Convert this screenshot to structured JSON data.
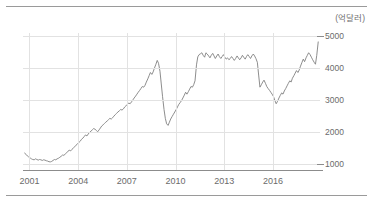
{
  "chart_data": {
    "type": "line",
    "title": "",
    "subtitle": "",
    "xlabel": "",
    "ylabel": "",
    "unit_label": "(억달러)",
    "grid": true,
    "legend": false,
    "legend_position": "none",
    "xlim": [
      2000.6,
      2018.9
    ],
    "ylim": [
      800,
      5100
    ],
    "y_ticks": [
      1000,
      2000,
      3000,
      4000,
      5000
    ],
    "y_tick_labels": [
      "1000",
      "2000",
      "3000",
      "4000",
      "5000"
    ],
    "x_ticks": [
      2001,
      2004,
      2007,
      2010,
      2013,
      2016
    ],
    "x_tick_labels": [
      "2001",
      "2004",
      "2007",
      "2010",
      "2013",
      "2016"
    ],
    "series": [
      {
        "name": "foreign-exchange-reserves",
        "color": "#808080",
        "x": [
          2000.7,
          2000.79,
          2000.87,
          2000.95,
          2001.04,
          2001.12,
          2001.2,
          2001.29,
          2001.37,
          2001.45,
          2001.54,
          2001.62,
          2001.7,
          2001.79,
          2001.87,
          2001.95,
          2002.04,
          2002.12,
          2002.2,
          2002.29,
          2002.37,
          2002.45,
          2002.54,
          2002.62,
          2002.7,
          2002.79,
          2002.87,
          2002.95,
          2003.04,
          2003.12,
          2003.2,
          2003.29,
          2003.37,
          2003.45,
          2003.54,
          2003.62,
          2003.7,
          2003.79,
          2003.87,
          2003.95,
          2004.04,
          2004.12,
          2004.2,
          2004.29,
          2004.37,
          2004.45,
          2004.54,
          2004.62,
          2004.7,
          2004.79,
          2004.87,
          2004.95,
          2005.04,
          2005.12,
          2005.2,
          2005.29,
          2005.37,
          2005.45,
          2005.54,
          2005.62,
          2005.7,
          2005.79,
          2005.87,
          2005.95,
          2006.04,
          2006.12,
          2006.2,
          2006.29,
          2006.37,
          2006.45,
          2006.54,
          2006.62,
          2006.7,
          2006.79,
          2006.87,
          2006.95,
          2007.04,
          2007.12,
          2007.2,
          2007.29,
          2007.37,
          2007.45,
          2007.54,
          2007.62,
          2007.7,
          2007.79,
          2007.87,
          2007.95,
          2008.04,
          2008.12,
          2008.2,
          2008.29,
          2008.37,
          2008.45,
          2008.54,
          2008.62,
          2008.7,
          2008.79,
          2008.87,
          2008.95,
          2009.04,
          2009.12,
          2009.2,
          2009.29,
          2009.37,
          2009.45,
          2009.54,
          2009.62,
          2009.7,
          2009.79,
          2009.87,
          2009.95,
          2010.04,
          2010.12,
          2010.2,
          2010.29,
          2010.37,
          2010.45,
          2010.54,
          2010.62,
          2010.7,
          2010.79,
          2010.87,
          2010.95,
          2011.04,
          2011.12,
          2011.2,
          2011.29,
          2011.37,
          2011.45,
          2011.54,
          2011.62,
          2011.7,
          2011.79,
          2011.87,
          2011.95,
          2012.04,
          2012.12,
          2012.2,
          2012.29,
          2012.37,
          2012.45,
          2012.54,
          2012.62,
          2012.7,
          2012.79,
          2012.87,
          2012.95,
          2013.04,
          2013.12,
          2013.2,
          2013.29,
          2013.37,
          2013.45,
          2013.54,
          2013.62,
          2013.7,
          2013.79,
          2013.87,
          2013.95,
          2014.04,
          2014.12,
          2014.2,
          2014.29,
          2014.37,
          2014.45,
          2014.54,
          2014.62,
          2014.7,
          2014.79,
          2014.87,
          2014.95,
          2015.04,
          2015.12,
          2015.2,
          2015.29,
          2015.37,
          2015.45,
          2015.54,
          2015.62,
          2015.7,
          2015.79,
          2015.87,
          2015.95,
          2016.04,
          2016.12,
          2016.2,
          2016.29,
          2016.37,
          2016.45,
          2016.54,
          2016.62,
          2016.7,
          2016.79,
          2016.87,
          2016.95,
          2017.04,
          2017.12,
          2017.2,
          2017.29,
          2017.37,
          2017.45,
          2017.54,
          2017.62,
          2017.7,
          2017.79,
          2017.87,
          2017.95,
          2018.04,
          2018.12,
          2018.2,
          2018.29,
          2018.37,
          2018.45,
          2018.54,
          2018.62,
          2018.7,
          2018.79
        ],
        "values": [
          1330,
          1290,
          1240,
          1210,
          1180,
          1150,
          1130,
          1120,
          1150,
          1130,
          1110,
          1130,
          1120,
          1100,
          1120,
          1110,
          1090,
          1080,
          1060,
          1055,
          1070,
          1100,
          1130,
          1120,
          1150,
          1170,
          1200,
          1230,
          1270,
          1260,
          1300,
          1340,
          1390,
          1420,
          1400,
          1450,
          1490,
          1530,
          1580,
          1620,
          1660,
          1700,
          1760,
          1800,
          1850,
          1900,
          1870,
          1930,
          1980,
          2020,
          2060,
          2100,
          2080,
          2040,
          2000,
          2060,
          2120,
          2180,
          2220,
          2260,
          2300,
          2340,
          2380,
          2420,
          2400,
          2440,
          2490,
          2540,
          2580,
          2620,
          2660,
          2700,
          2680,
          2720,
          2780,
          2820,
          2860,
          2900,
          2880,
          2940,
          3000,
          3060,
          3120,
          3180,
          3240,
          3300,
          3360,
          3420,
          3400,
          3460,
          3560,
          3660,
          3760,
          3860,
          3800,
          3880,
          4000,
          4120,
          4240,
          4150,
          3900,
          3500,
          3100,
          2700,
          2420,
          2250,
          2200,
          2300,
          2400,
          2480,
          2550,
          2620,
          2700,
          2780,
          2860,
          2920,
          2980,
          3060,
          3150,
          3240,
          3180,
          3260,
          3340,
          3420,
          3400,
          3480,
          3600,
          4100,
          4350,
          4420,
          4450,
          4480,
          4400,
          4340,
          4480,
          4440,
          4380,
          4320,
          4400,
          4460,
          4380,
          4300,
          4380,
          4440,
          4360,
          4300,
          4360,
          4420,
          4340,
          4280,
          4320,
          4260,
          4300,
          4360,
          4300,
          4240,
          4300,
          4380,
          4320,
          4260,
          4320,
          4400,
          4340,
          4280,
          4360,
          4420,
          4360,
          4300,
          4380,
          4440,
          4380,
          4300,
          4180,
          3780,
          3400,
          3480,
          3560,
          3620,
          3520,
          3420,
          3360,
          3300,
          3240,
          3180,
          3100,
          2980,
          2880,
          2960,
          3060,
          3140,
          3220,
          3180,
          3280,
          3360,
          3440,
          3520,
          3600,
          3560,
          3680,
          3760,
          3840,
          3920,
          3860,
          3940,
          4060,
          4180,
          4280,
          4200,
          4320,
          4400,
          4480,
          4420,
          4340,
          4260,
          4180,
          4120,
          4400,
          4820
        ]
      }
    ]
  }
}
